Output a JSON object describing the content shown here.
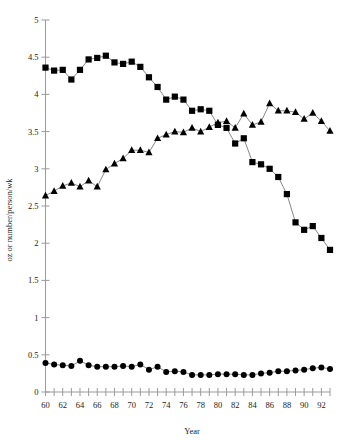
{
  "chart_data": {
    "type": "line",
    "title": "",
    "xlabel": "Year",
    "ylabel": "oz or number/person/wk",
    "xlim": [
      60,
      93
    ],
    "ylim": [
      0,
      5
    ],
    "ytick_values": [
      0,
      0.5,
      1,
      1.5,
      2,
      2.5,
      3,
      3.5,
      4,
      4.5,
      5
    ],
    "ytick_labels": [
      "0",
      "0.5",
      "1",
      "1.5",
      "2",
      "2.5",
      "3",
      "3.5",
      "4",
      "4.5",
      "5"
    ],
    "xtick_values": [
      60,
      61,
      62,
      63,
      64,
      65,
      66,
      67,
      68,
      69,
      70,
      71,
      72,
      73,
      74,
      75,
      76,
      77,
      78,
      79,
      80,
      81,
      82,
      83,
      84,
      85,
      86,
      87,
      88,
      89,
      90,
      91,
      92,
      93
    ],
    "xtick_labels_shown": [
      "60",
      "62",
      "64",
      "66",
      "68",
      "70",
      "72",
      "74",
      "76",
      "78",
      "80",
      "82",
      "84",
      "86",
      "88",
      "90",
      "92"
    ],
    "grid": false,
    "legend": "none",
    "x": [
      60,
      61,
      62,
      63,
      64,
      65,
      66,
      67,
      68,
      69,
      70,
      71,
      72,
      73,
      74,
      75,
      76,
      77,
      78,
      79,
      80,
      81,
      82,
      83,
      84,
      85,
      86,
      87,
      88,
      89,
      90,
      91,
      92,
      93
    ],
    "series": [
      {
        "name": "squares",
        "marker": "square",
        "color": "#000000",
        "values": [
          4.36,
          4.32,
          4.33,
          4.2,
          4.33,
          4.47,
          4.49,
          4.52,
          4.43,
          4.41,
          4.44,
          4.37,
          4.23,
          4.1,
          3.93,
          3.97,
          3.93,
          3.78,
          3.8,
          3.78,
          3.59,
          3.55,
          3.34,
          3.41,
          3.09,
          3.06,
          3.0,
          2.89,
          2.66,
          2.28,
          2.18,
          2.23,
          2.07,
          1.91
        ]
      },
      {
        "name": "triangles",
        "marker": "triangle",
        "color": "#000000",
        "values": [
          2.64,
          2.7,
          2.77,
          2.81,
          2.76,
          2.84,
          2.76,
          2.99,
          3.07,
          3.14,
          3.25,
          3.25,
          3.22,
          3.41,
          3.46,
          3.5,
          3.49,
          3.55,
          3.5,
          3.56,
          3.62,
          3.64,
          3.55,
          3.74,
          3.59,
          3.63,
          3.88,
          3.78,
          3.78,
          3.76,
          3.67,
          3.75,
          3.64,
          3.51
        ]
      },
      {
        "name": "circles",
        "marker": "circle",
        "color": "#000000",
        "values": [
          0.39,
          0.37,
          0.36,
          0.35,
          0.42,
          0.36,
          0.34,
          0.34,
          0.34,
          0.35,
          0.34,
          0.37,
          0.3,
          0.34,
          0.27,
          0.28,
          0.27,
          0.23,
          0.23,
          0.23,
          0.24,
          0.24,
          0.24,
          0.23,
          0.23,
          0.25,
          0.26,
          0.28,
          0.28,
          0.29,
          0.3,
          0.32,
          0.33,
          0.31
        ]
      }
    ]
  }
}
